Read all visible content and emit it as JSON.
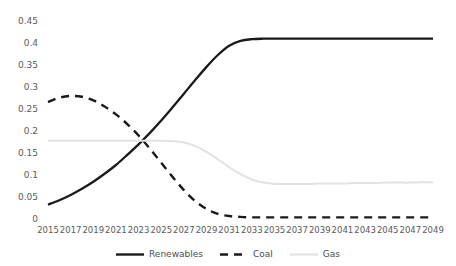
{
  "chart_data": {
    "type": "line",
    "title": "",
    "xlabel": "",
    "ylabel": "",
    "xlim": [
      2015,
      2049
    ],
    "ylim": [
      0,
      0.45
    ],
    "grid": false,
    "legend_position": "bottom",
    "x": [
      2015,
      2016,
      2017,
      2018,
      2019,
      2020,
      2021,
      2022,
      2023,
      2024,
      2025,
      2026,
      2027,
      2028,
      2029,
      2030,
      2031,
      2032,
      2033,
      2034,
      2035,
      2036,
      2037,
      2038,
      2039,
      2040,
      2041,
      2042,
      2043,
      2044,
      2045,
      2046,
      2047,
      2048,
      2049
    ],
    "xtick_labels": [
      "2015",
      "2017",
      "2019",
      "2021",
      "2023",
      "2025",
      "2027",
      "2029",
      "2031",
      "2033",
      "2035",
      "2037",
      "2039",
      "2041",
      "2043",
      "2045",
      "2047",
      "2049"
    ],
    "ytick_labels": [
      "0",
      "0.05",
      "0.1",
      "0.15",
      "0.2",
      "0.25",
      "0.3",
      "0.35",
      "0.4",
      "0.45"
    ],
    "ytick_values": [
      0,
      0.05,
      0.1,
      0.15,
      0.2,
      0.25,
      0.3,
      0.35,
      0.4,
      0.45
    ],
    "series": [
      {
        "name": "Renewables",
        "color": "#1a1a1a",
        "style": "solid",
        "values": [
          0.035,
          0.045,
          0.057,
          0.071,
          0.087,
          0.105,
          0.125,
          0.148,
          0.172,
          0.198,
          0.226,
          0.256,
          0.287,
          0.318,
          0.348,
          0.375,
          0.396,
          0.407,
          0.411,
          0.412,
          0.412,
          0.412,
          0.412,
          0.412,
          0.412,
          0.412,
          0.412,
          0.412,
          0.412,
          0.412,
          0.412,
          0.412,
          0.412,
          0.412,
          0.412
        ]
      },
      {
        "name": "Coal",
        "color": "#1a1a1a",
        "style": "dashed",
        "values": [
          0.268,
          0.278,
          0.282,
          0.28,
          0.272,
          0.258,
          0.24,
          0.218,
          0.192,
          0.162,
          0.13,
          0.098,
          0.068,
          0.043,
          0.025,
          0.014,
          0.009,
          0.007,
          0.006,
          0.006,
          0.006,
          0.006,
          0.006,
          0.006,
          0.006,
          0.006,
          0.006,
          0.006,
          0.006,
          0.006,
          0.006,
          0.006,
          0.006,
          0.006,
          0.006
        ]
      },
      {
        "name": "Gas",
        "color": "#e2e2e2",
        "style": "solid",
        "values": [
          0.18,
          0.18,
          0.18,
          0.18,
          0.18,
          0.18,
          0.18,
          0.18,
          0.18,
          0.18,
          0.18,
          0.179,
          0.176,
          0.168,
          0.155,
          0.138,
          0.12,
          0.104,
          0.092,
          0.085,
          0.082,
          0.082,
          0.082,
          0.082,
          0.083,
          0.083,
          0.083,
          0.084,
          0.084,
          0.084,
          0.085,
          0.085,
          0.085,
          0.086,
          0.086
        ]
      }
    ]
  },
  "legend": {
    "items": [
      {
        "label": "Renewables"
      },
      {
        "label": "Coal"
      },
      {
        "label": "Gas"
      }
    ]
  }
}
